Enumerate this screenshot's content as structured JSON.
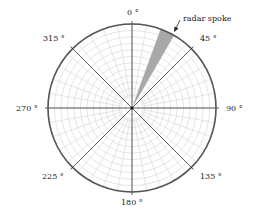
{
  "diagram": {
    "title": "",
    "center": [
      132,
      108
    ],
    "radius": 84,
    "ring_count": 13,
    "minor_spoke_step_deg": 10,
    "major_spokes_deg": [
      0,
      45,
      90,
      135,
      180,
      225,
      270,
      315
    ],
    "angle_labels": [
      {
        "angle": 0,
        "text": "0 °"
      },
      {
        "angle": 45,
        "text": "45 °"
      },
      {
        "angle": 90,
        "text": "90 °"
      },
      {
        "angle": 135,
        "text": "135 °"
      },
      {
        "angle": 180,
        "text": "180 °"
      },
      {
        "angle": 225,
        "text": "225 °"
      },
      {
        "angle": 270,
        "text": "270 °"
      },
      {
        "angle": 315,
        "text": "315 °"
      }
    ],
    "highlighted_spoke": {
      "start_deg": 20,
      "end_deg": 30,
      "color": "#a8a8a8"
    },
    "annotation": {
      "text": "radar spoke"
    },
    "colors": {
      "outer_ring": "#555555",
      "grid": "#d4d4d4",
      "major_spoke": "#333333"
    }
  }
}
